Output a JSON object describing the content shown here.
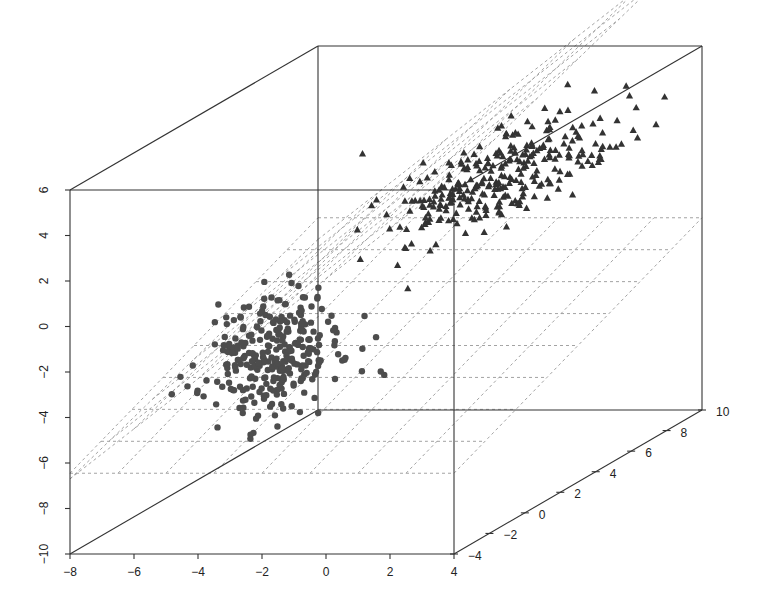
{
  "chart_data": {
    "type": "scatter3d",
    "title": "",
    "xlabel": "",
    "ylabel": "",
    "zlabel": "",
    "x_axis": {
      "ticks": [
        -8,
        -6,
        -4,
        -2,
        0,
        2,
        4
      ],
      "range": [
        -8,
        4
      ]
    },
    "z_axis_vertical": {
      "ticks": [
        -10,
        -8,
        -6,
        -4,
        -2,
        0,
        2,
        4,
        6
      ],
      "range": [
        -10,
        6
      ]
    },
    "depth_axis": {
      "ticks": [
        -4,
        -2,
        0,
        2,
        4,
        6,
        8,
        10
      ],
      "range": [
        -4,
        10
      ]
    },
    "series": [
      {
        "name": "class-circles",
        "marker": "circle",
        "color": "#4d4d4d",
        "count": 300,
        "center": {
          "x": -3.0,
          "depth": -1.5,
          "z": -2.5
        },
        "spread": {
          "x": 0.8,
          "depth": 1.2,
          "z": 1.3
        },
        "seed": 7
      },
      {
        "name": "class-triangles",
        "marker": "triangle",
        "color": "#333333",
        "count": 300,
        "center": {
          "x": 1.2,
          "depth": 3.5,
          "z": 3.2
        },
        "spread": {
          "x": 1.4,
          "depth": 2.2,
          "z": 1.0
        },
        "seed": 13
      }
    ],
    "planes": [
      {
        "name": "flat-plane",
        "style": "dashed",
        "color": "#999999",
        "z_at": -4.0,
        "slope_x": 0.0,
        "slope_depth": 0.35,
        "grid": 8
      },
      {
        "name": "tilted-plane",
        "style": "dashed",
        "color": "#999999",
        "z_at": 2.0,
        "slope_x": 2.2,
        "slope_depth": 0.3,
        "grid": 6
      }
    ],
    "grid": false,
    "legend": null
  },
  "layout": {
    "front_box": {
      "left": 70,
      "right": 454,
      "top": 190,
      "bottom": 554
    },
    "depth_offset": {
      "dx": 248,
      "dy": -144
    }
  }
}
